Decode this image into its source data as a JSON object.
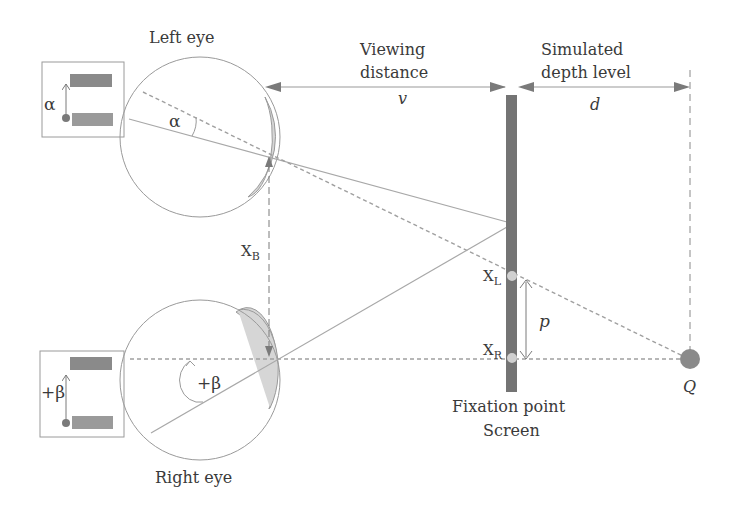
{
  "diagram": {
    "type": "stereoscopic-depth-geometry",
    "labels": {
      "left_eye": "Left eye",
      "right_eye": "Right eye",
      "viewing_line1": "Viewing",
      "viewing_line2": "distance",
      "viewing_symbol": "v",
      "depth_line1": "Simulated",
      "depth_line2": "depth level",
      "depth_symbol": "d",
      "alpha_inset": "α",
      "alpha_angle": "α",
      "beta_inset": "+β",
      "beta_angle": "+β",
      "xb_main": "X",
      "xb_sub": "B",
      "xl_main": "X",
      "xl_sub": "L",
      "xr_main": "X",
      "xr_sub": "R",
      "parallax": "p",
      "point_q": "Q",
      "fixation_line1": "Fixation point",
      "fixation_line2": "Screen"
    },
    "colors": {
      "line": "#a0a0a0",
      "dark": "#6e6e6e",
      "screen": "#707070",
      "cornea": "#d8d8d8",
      "text": "#3a3a3a"
    }
  }
}
